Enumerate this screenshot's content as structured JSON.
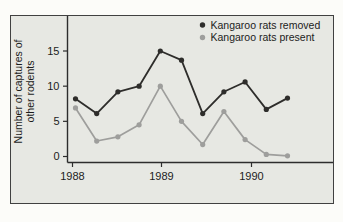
{
  "colors": {
    "page_bg": "#fcfcf9",
    "panel_bg": "#e7e8e3",
    "panel_border": "#414141",
    "axis": "#2d2d2d",
    "text": "#1c1c1c"
  },
  "chart_data": {
    "type": "line",
    "title": "",
    "ylabel": "Number of captures of other rodents",
    "ylabel_lines": [
      "Number of captures of",
      "other rodents"
    ],
    "xlabel": "",
    "y_ticks": [
      0,
      5,
      10,
      15
    ],
    "ylim": [
      0,
      17.5
    ],
    "x_tick_labels": [
      "1988",
      "1989",
      "1990"
    ],
    "x": [
      0,
      1,
      2,
      3,
      4,
      5,
      6,
      7,
      8,
      9,
      10
    ],
    "grid": false,
    "legend_position": "top-right",
    "series": [
      {
        "name": "Kangaroo rats removed",
        "color": "#2e2d2b",
        "values": [
          8.2,
          6.1,
          9.2,
          10,
          15,
          13.7,
          6.1,
          9.2,
          10.6,
          6.7,
          8.3
        ]
      },
      {
        "name": "Kangaroo rats present",
        "color": "#9e9e9c",
        "values": [
          6.9,
          2.2,
          2.8,
          4.5,
          10,
          5,
          1.7,
          6.4,
          2.4,
          0.3,
          0.1
        ]
      }
    ]
  }
}
